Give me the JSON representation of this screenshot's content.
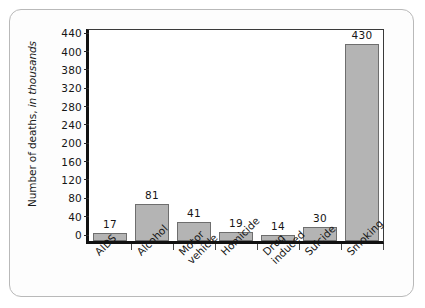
{
  "chart_data": {
    "type": "bar",
    "title": "",
    "xlabel": "",
    "ylabel": "Number of deaths, in thousands",
    "ylabel_plain": "Number of deaths,",
    "ylabel_italic": " in thousands",
    "categories": [
      "AIDS",
      "Alcohol",
      "Motor vehicle",
      "Homicide",
      "Drug induced",
      "Suicide",
      "Smoking"
    ],
    "category_lines": [
      [
        "AIDS"
      ],
      [
        "Alcohol"
      ],
      [
        "Motor",
        "vehicle"
      ],
      [
        "Homicide"
      ],
      [
        "Drug",
        "induced"
      ],
      [
        "Suicide"
      ],
      [
        "Smoking"
      ]
    ],
    "values": [
      17,
      81,
      41,
      19,
      14,
      30,
      430
    ],
    "value_labels": [
      "17",
      "81",
      "41",
      "19",
      "14",
      "30",
      "430"
    ],
    "ylim": [
      0,
      460
    ],
    "ytick_labels": [
      "440",
      "400",
      "380",
      "320",
      "280",
      "240",
      "200",
      "160",
      "120",
      "80",
      "40",
      "0"
    ],
    "ytick_values": [
      440,
      400,
      360,
      320,
      280,
      240,
      200,
      160,
      120,
      80,
      40,
      0
    ],
    "grid": false,
    "legend": false,
    "colors": {
      "bar_fill": "#b4b4b4",
      "bar_border": "#6e6e6e",
      "axis": "#111111",
      "text": "#161616",
      "frame_border": "#b9b9b9",
      "plot_background": "#ffffff",
      "page_background": "#fdfdfd"
    }
  }
}
